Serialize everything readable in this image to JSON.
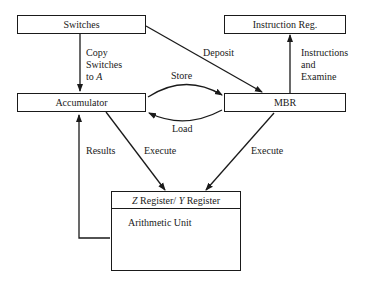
{
  "diagram": {
    "nodes": {
      "switches": "Switches",
      "instruction_reg": "Instruction Reg.",
      "accumulator": "Accumulator",
      "mbr": "MBR",
      "zy_register": {
        "z": "Z",
        "register1": " Register/ ",
        "y": "Y",
        "register2": " Register"
      },
      "arithmetic_unit": "Arithmetic Unit"
    },
    "edges": {
      "copy_switches": [
        "Copy",
        "Switches",
        "to "
      ],
      "copy_switches_a": "A",
      "deposit": "Deposit",
      "store": "Store",
      "load": "Load",
      "instructions_examine": [
        "Instructions",
        "and",
        "Examine"
      ],
      "results": "Results",
      "execute_left": "Execute",
      "execute_right": "Execute"
    }
  }
}
